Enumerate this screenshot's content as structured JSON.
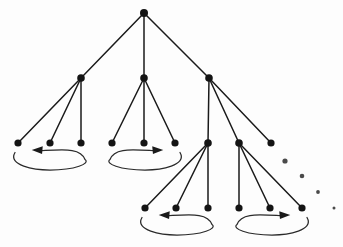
{
  "figure": {
    "width": 343,
    "height": 247,
    "background_color": "#fdfdfd",
    "node_color": "#141414",
    "edge_color": "#1a1a1a",
    "loop_color": "#2a2a2a",
    "ellipsis_color": "#4a4a4a"
  },
  "chart_data": {
    "type": "diagram",
    "title": "",
    "xlabel": "",
    "ylabel": "",
    "grid": false,
    "legend": null,
    "nodes": [
      {
        "id": "root",
        "x": 144,
        "y": 13,
        "r": 4.0,
        "level": 0
      },
      {
        "id": "a",
        "x": 81,
        "y": 78,
        "r": 3.8,
        "level": 1
      },
      {
        "id": "b",
        "x": 144,
        "y": 78,
        "r": 3.8,
        "level": 1
      },
      {
        "id": "c",
        "x": 209,
        "y": 78,
        "r": 3.8,
        "level": 1
      },
      {
        "id": "a1",
        "x": 18,
        "y": 143,
        "r": 3.6,
        "level": 2
      },
      {
        "id": "a2",
        "x": 50,
        "y": 143,
        "r": 3.6,
        "level": 2
      },
      {
        "id": "a3",
        "x": 81,
        "y": 143,
        "r": 3.6,
        "level": 2
      },
      {
        "id": "b1",
        "x": 112,
        "y": 143,
        "r": 3.6,
        "level": 2
      },
      {
        "id": "b2",
        "x": 144,
        "y": 143,
        "r": 3.6,
        "level": 2
      },
      {
        "id": "b3",
        "x": 175,
        "y": 143,
        "r": 3.6,
        "level": 2
      },
      {
        "id": "c1",
        "x": 208,
        "y": 143,
        "r": 3.8,
        "level": 2
      },
      {
        "id": "c2",
        "x": 239,
        "y": 143,
        "r": 3.8,
        "level": 2
      },
      {
        "id": "c3",
        "x": 271,
        "y": 143,
        "r": 3.6,
        "level": 2
      },
      {
        "id": "c1a",
        "x": 145,
        "y": 208,
        "r": 3.6,
        "level": 3
      },
      {
        "id": "c1b",
        "x": 176,
        "y": 208,
        "r": 3.6,
        "level": 3
      },
      {
        "id": "c1c",
        "x": 208,
        "y": 208,
        "r": 3.6,
        "level": 3
      },
      {
        "id": "c2a",
        "x": 239,
        "y": 208,
        "r": 3.6,
        "level": 3
      },
      {
        "id": "c2b",
        "x": 270,
        "y": 208,
        "r": 3.6,
        "level": 3
      },
      {
        "id": "c2c",
        "x": 302,
        "y": 208,
        "r": 3.6,
        "level": 3
      }
    ],
    "edges": [
      {
        "from": "root",
        "to": "a"
      },
      {
        "from": "root",
        "to": "b"
      },
      {
        "from": "root",
        "to": "c"
      },
      {
        "from": "a",
        "to": "a1"
      },
      {
        "from": "a",
        "to": "a2"
      },
      {
        "from": "a",
        "to": "a3"
      },
      {
        "from": "b",
        "to": "b1"
      },
      {
        "from": "b",
        "to": "b2"
      },
      {
        "from": "b",
        "to": "b3"
      },
      {
        "from": "c",
        "to": "c1"
      },
      {
        "from": "c",
        "to": "c2"
      },
      {
        "from": "c",
        "to": "c3"
      },
      {
        "from": "c1",
        "to": "c1a"
      },
      {
        "from": "c1",
        "to": "c1b"
      },
      {
        "from": "c1",
        "to": "c1c"
      },
      {
        "from": "c2",
        "to": "c2a"
      },
      {
        "from": "c2",
        "to": "c2b"
      },
      {
        "from": "c2",
        "to": "c2c"
      }
    ],
    "loops": [
      {
        "id": "loop-left-upper",
        "direction": "left",
        "cx": 50,
        "cy": 160,
        "rx": 35,
        "ry": 10
      },
      {
        "id": "loop-middle-upper",
        "direction": "right",
        "cx": 145,
        "cy": 160,
        "rx": 35,
        "ry": 10
      },
      {
        "id": "loop-left-lower",
        "direction": "left",
        "cx": 177,
        "cy": 225,
        "rx": 35,
        "ry": 10
      },
      {
        "id": "loop-right-lower",
        "direction": "right",
        "cx": 272,
        "cy": 225,
        "rx": 35,
        "ry": 10
      }
    ],
    "ellipsis_dots": [
      {
        "x": 285,
        "y": 161,
        "r": 2.6
      },
      {
        "x": 302,
        "y": 176,
        "r": 2.3
      },
      {
        "x": 318,
        "y": 192,
        "r": 1.9
      },
      {
        "x": 334,
        "y": 208,
        "r": 1.5
      }
    ]
  }
}
